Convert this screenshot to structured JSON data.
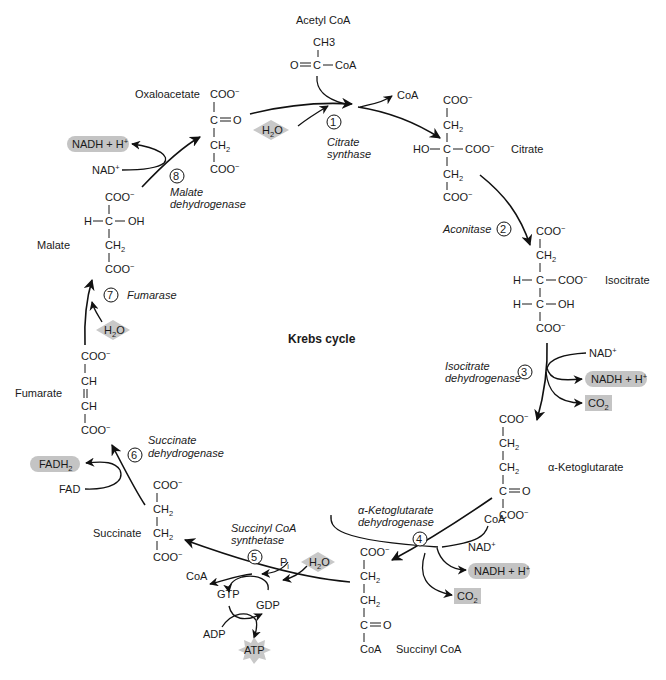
{
  "title": "Krebs cycle",
  "compounds": {
    "acetyl_coa": {
      "name": "Acetyl CoA",
      "ch3": "CH3",
      "o": "O",
      "c": "C",
      "coa": "CoA"
    },
    "citrate": {
      "name": "Citrate"
    },
    "isocitrate": {
      "name": "Isocitrate"
    },
    "alpha_ketoglutarate": {
      "name": "α-Ketoglutarate"
    },
    "succinyl_coa": {
      "name": "Succinyl CoA"
    },
    "succinate": {
      "name": "Succinate"
    },
    "fumarate": {
      "name": "Fumarate"
    },
    "malate": {
      "name": "Malate"
    },
    "oxaloacetate": {
      "name": "Oxaloacetate"
    }
  },
  "groups": {
    "coo": "COO",
    "minus": "−",
    "ch2": "CH",
    "two": "2",
    "ch": "CH",
    "c": "C",
    "o": "O",
    "ho": "HO",
    "h": "H",
    "oh": "OH",
    "coa": "CoA"
  },
  "enzymes": [
    {
      "step": "1",
      "line1": "Citrate",
      "line2": "synthase"
    },
    {
      "step": "2",
      "line1": "Aconitase",
      "line2": ""
    },
    {
      "step": "3",
      "line1": "Isocitrate",
      "line2": "dehydrogenase"
    },
    {
      "step": "4",
      "line1": "α-Ketoglutarate",
      "line2": "dehydrogenase"
    },
    {
      "step": "5",
      "line1": "Succinyl CoA",
      "line2": "synthetase"
    },
    {
      "step": "6",
      "line1": "Succinate",
      "line2": "dehydrogenase"
    },
    {
      "step": "7",
      "line1": "Fumarase",
      "line2": ""
    },
    {
      "step": "8",
      "line1": "Malate",
      "line2": "dehydrogenase"
    }
  ],
  "cofactors": {
    "coa": "CoA",
    "h2o_h": "H",
    "h2o_2": "2",
    "h2o_o": "O",
    "nad": "NAD",
    "nad_plus": "+",
    "nadh": "NADH + H",
    "nadh_plus": "+",
    "co2": "CO",
    "co2_2": "2",
    "fadh2": "FADH",
    "fadh2_2": "2",
    "fad": "FAD",
    "pi": "P",
    "pi_i": "i",
    "gtp": "GTP",
    "gdp": "GDP",
    "adp": "ADP",
    "atp": "ATP"
  },
  "colors": {
    "highlight": "#c4c4c4",
    "line": "#111111"
  }
}
